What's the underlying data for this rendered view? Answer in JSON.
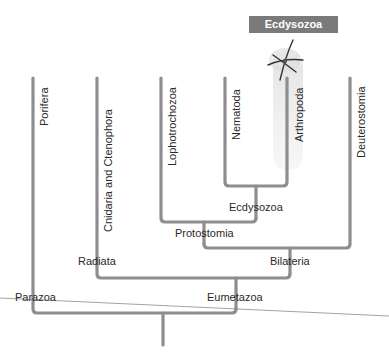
{
  "header": {
    "title": "Ecdysozoa",
    "box_color": "#7a7a7a"
  },
  "taxa": [
    {
      "label": "Porifera"
    },
    {
      "label": "Cnidaria and Ctenophora"
    },
    {
      "label": "Lophotrochozoa"
    },
    {
      "label": "Nematoda"
    },
    {
      "label": "Arthropoda"
    },
    {
      "label": "Deuterostomia"
    }
  ],
  "nodes": {
    "ecdysozoa": "Ecdysozoa",
    "protostomia": "Protostomia",
    "bilateria": "Bilateria",
    "radiata": "Radiata",
    "eumetazoa": "Eumetazoa",
    "parazoa": "Parazoa"
  },
  "colors": {
    "branch": "#8e8e8e",
    "highlight": "#ececec",
    "text": "#2a2a2a"
  },
  "icons": {
    "arthropod": "arthropod-icon"
  }
}
